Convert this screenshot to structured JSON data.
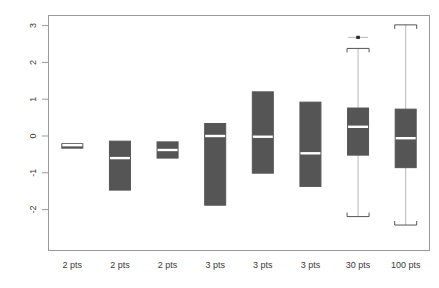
{
  "chart_data": {
    "type": "boxplot",
    "title": "",
    "xlabel": "",
    "ylabel": "",
    "categories": [
      "2 pts",
      "2 pts",
      "2 pts",
      "3 pts",
      "3 pts",
      "3 pts",
      "30 pts",
      "100 pts"
    ],
    "yticks": [
      3,
      2,
      1,
      0,
      -1,
      -2
    ],
    "yticklabels": [
      "3",
      "2",
      "1",
      "0",
      "-1",
      "-2"
    ],
    "ylim": [
      -2.55,
      3.2
    ],
    "grid": false,
    "legend": null,
    "box_fill_color": "#555555",
    "median_color": "#ffffff",
    "frame_color": "#999999",
    "boxes": [
      {
        "category": "2 pts",
        "q1": -0.33,
        "median": -0.25,
        "q3": -0.21,
        "whisker_low": -0.33,
        "whisker_high": -0.21,
        "outliers": []
      },
      {
        "category": "2 pts",
        "q1": -1.47,
        "median": -0.6,
        "q3": -0.14,
        "whisker_low": -1.47,
        "whisker_high": -0.14,
        "outliers": []
      },
      {
        "category": "2 pts",
        "q1": -0.6,
        "median": -0.38,
        "q3": -0.16,
        "whisker_low": -0.6,
        "whisker_high": -0.16,
        "outliers": []
      },
      {
        "category": "3 pts",
        "q1": -1.88,
        "median": 0.0,
        "q3": 0.34,
        "whisker_low": -1.88,
        "whisker_high": 0.34,
        "outliers": []
      },
      {
        "category": "3 pts",
        "q1": -1.01,
        "median": -0.02,
        "q3": 1.2,
        "whisker_low": -1.01,
        "whisker_high": 1.2,
        "outliers": []
      },
      {
        "category": "3 pts",
        "q1": -1.37,
        "median": -0.47,
        "q3": 0.92,
        "whisker_low": -1.37,
        "whisker_high": 0.92,
        "outliers": []
      },
      {
        "category": "30 pts",
        "q1": -0.52,
        "median": 0.25,
        "q3": 0.76,
        "whisker_low": -2.19,
        "whisker_high": 2.38,
        "outliers": [
          2.68
        ]
      },
      {
        "category": "100 pts",
        "q1": -0.86,
        "median": -0.06,
        "q3": 0.73,
        "whisker_low": -2.42,
        "whisker_high": 3.02,
        "outliers": []
      }
    ]
  },
  "axis": {
    "y_tick_0": "3",
    "y_tick_1": "2",
    "y_tick_2": "1",
    "y_tick_3": "0",
    "y_tick_4": "-1",
    "y_tick_5": "-2"
  },
  "xlabels": {
    "l0": "2 pts",
    "l1": "2 pts",
    "l2": "2 pts",
    "l3": "3 pts",
    "l4": "3 pts",
    "l5": "3 pts",
    "l6": "30 pts",
    "l7": "100 pts"
  }
}
